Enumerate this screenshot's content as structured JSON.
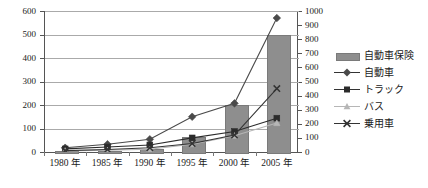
{
  "chart_data": {
    "type": "bar",
    "title": "",
    "subtitle": "",
    "xlabel": "",
    "ylabel": "",
    "categories": [
      "1980 年",
      "1985 年",
      "1990 年",
      "1995 年",
      "2000 年",
      "2005 年"
    ],
    "grid": true,
    "legend_position": "right",
    "axes": {
      "left": {
        "min": 0,
        "max": 600,
        "step": 100,
        "ticks": [
          "0",
          "100",
          "200",
          "300",
          "400",
          "500",
          "600"
        ]
      },
      "right": {
        "min": 0,
        "max": 1000,
        "step": 100,
        "ticks": [
          "0",
          "100",
          "200",
          "300",
          "400",
          "500",
          "600",
          "700",
          "800",
          "900",
          "1000"
        ]
      }
    },
    "series": [
      {
        "name": "自動車保険",
        "render": "bar",
        "axis": "left",
        "color": "#8e8e8e",
        "values": [
          3,
          5,
          12,
          65,
          200,
          500
        ]
      },
      {
        "name": "自動車",
        "render": "line",
        "marker": "diamond",
        "axis": "right",
        "color": "#4a4a4a",
        "values": [
          30,
          55,
          90,
          250,
          345,
          950
        ]
      },
      {
        "name": "トラック",
        "render": "line",
        "marker": "square",
        "axis": "right",
        "color": "#2b2b2b",
        "values": [
          22,
          35,
          50,
          100,
          145,
          240
        ]
      },
      {
        "name": "バス",
        "render": "line",
        "marker": "triangle",
        "axis": "right",
        "color": "#b6b6b6",
        "values": [
          8,
          12,
          20,
          55,
          115,
          205
        ]
      },
      {
        "name": "乗用車",
        "render": "line",
        "marker": "cross",
        "axis": "right",
        "color": "#333333",
        "values": [
          10,
          18,
          30,
          60,
          120,
          450
        ]
      }
    ]
  },
  "legend": {
    "items": [
      {
        "label": "自動車保険",
        "key": "bar-key"
      },
      {
        "label": "自動車",
        "key": "diamond-key"
      },
      {
        "label": "トラック",
        "key": "square-key"
      },
      {
        "label": "バス",
        "key": "triangle-key"
      },
      {
        "label": "乗用車",
        "key": "cross-key"
      }
    ]
  }
}
